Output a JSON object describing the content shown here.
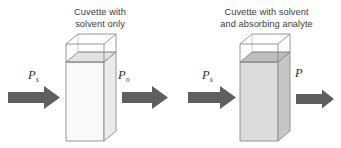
{
  "diagram": {
    "background_color": "#ffffff"
  },
  "panels": [
    {
      "id": "reference",
      "caption": "Cuvette with\nsolvent only",
      "caption_line1": "Cuvette with",
      "caption_line2": "solvent only",
      "incident_label": "P",
      "incident_subscript": "s",
      "outgoing_label": "P",
      "outgoing_subscript": "o",
      "cuvette_fill_color": "#f7f7f7",
      "cuvette_side_color": "#e6e6e6",
      "cuvette_outline_color": "#8a8a8a",
      "incident_arrow_color": "#5e5e5e",
      "outgoing_arrow_color": "#5e5e5e",
      "outgoing_arrow_thickness": "thick"
    },
    {
      "id": "sample",
      "caption": "Cuvette with solvent\nand absorbing analyte",
      "caption_line1": "Cuvette with solvent",
      "caption_line2": "and absorbing analyte",
      "incident_label": "P",
      "incident_subscript": "s",
      "outgoing_label": "P",
      "outgoing_subscript": "",
      "cuvette_fill_color": "#d9d9d9",
      "cuvette_side_color": "#c4c4c4",
      "cuvette_outline_color": "#8a8a8a",
      "incident_arrow_color": "#5e5e5e",
      "outgoing_arrow_color": "#5e5e5e",
      "outgoing_arrow_thickness": "thin"
    }
  ]
}
